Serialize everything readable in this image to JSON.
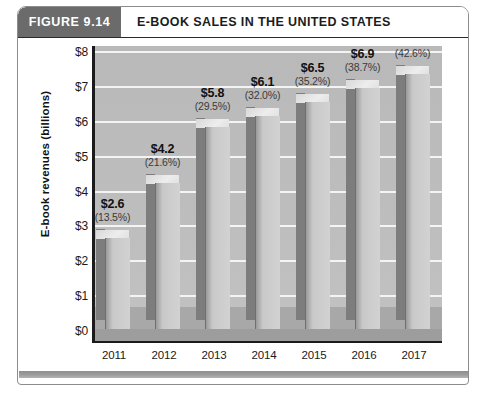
{
  "figure": {
    "number_label": "FIGURE 9.14",
    "title": "E-BOOK SALES IN THE UNITED STATES"
  },
  "chart_data": {
    "type": "bar",
    "title": "E-BOOK SALES IN THE UNITED STATES",
    "xlabel": "",
    "ylabel": "E-book revenues  (billions)",
    "categories": [
      "2011",
      "2012",
      "2013",
      "2014",
      "2015",
      "2016",
      "2017"
    ],
    "values": [
      2.6,
      4.2,
      5.8,
      6.1,
      6.5,
      6.9,
      7.3
    ],
    "value_labels": [
      "$2.6",
      "$4.2",
      "$5.8",
      "$6.1",
      "$6.5",
      "$6.9",
      "$7.3"
    ],
    "percent_labels": [
      "(13.5%)",
      "(21.6%)",
      "(29.5%)",
      "(32.0%)",
      "(35.2%)",
      "(38.7%)",
      "(42.6%)"
    ],
    "percent_values": [
      13.5,
      21.6,
      29.5,
      32.0,
      35.2,
      38.7,
      42.6
    ],
    "ylim": [
      0,
      8
    ],
    "ytick_labels": [
      "$0",
      "$1",
      "$2",
      "$3",
      "$4",
      "$5",
      "$6",
      "$7",
      "$8"
    ],
    "ytick_values": [
      0,
      1,
      2,
      3,
      4,
      5,
      6,
      7,
      8
    ],
    "grid": true,
    "legend": false,
    "style": "3d-column"
  },
  "colors": {
    "figure_number_bg": "#6b6b6b",
    "figure_number_text": "#ffffff",
    "title_text": "#1c1c1c",
    "plot_background": "#bdbdbd",
    "gridline": "#f4f4f4",
    "bar_front": "#c9c9c9",
    "bar_side": "#7d7d7d",
    "bar_top": "#e2e2e2",
    "axis": "#1b1b1b",
    "card_border": "#8c8c8c",
    "footer_rule": "#9c9c9c"
  }
}
